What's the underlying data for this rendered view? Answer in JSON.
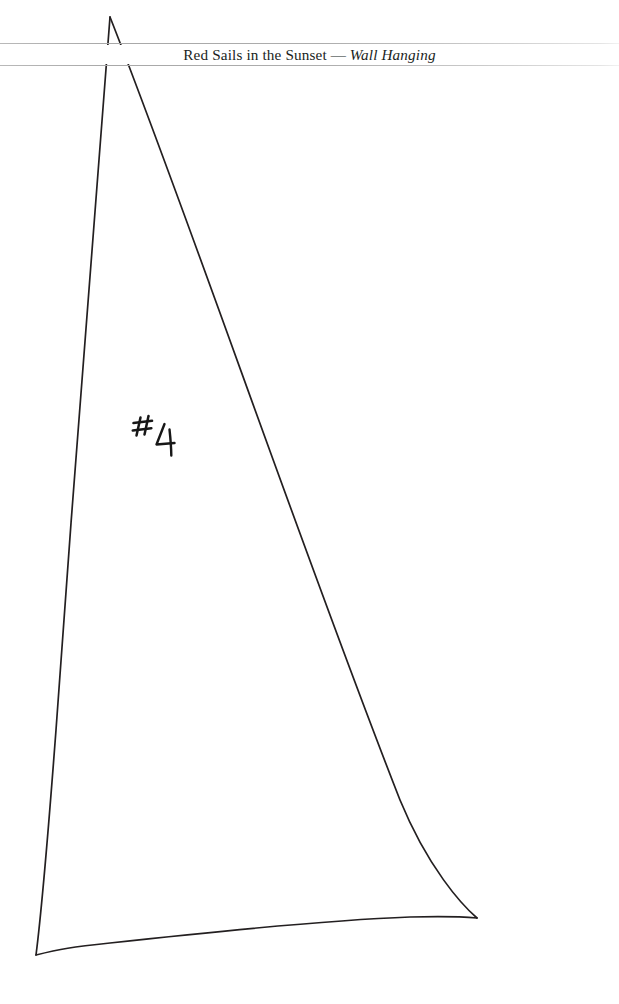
{
  "page": {
    "background_color": "#ffffff",
    "width": 619,
    "height": 1004
  },
  "header": {
    "running_head_plain": "Red Sails in the Sunset",
    "separator": " — ",
    "running_head_italic": "Wall Hanging",
    "full_text": "Red Sails in the Sunset — Wall Hanging",
    "rule_color": "#adadad",
    "text_color": "#201e1d"
  },
  "figure": {
    "name": "sail-pattern-piece",
    "stroke_color": "#231f20",
    "apex": {
      "x": 110,
      "y": 17
    },
    "bottom_left": {
      "x": 36,
      "y": 955
    },
    "bottom_right": {
      "x": 477,
      "y": 918
    }
  },
  "annotation": {
    "piece_number_symbol": "#",
    "piece_number": "4",
    "piece_label": "#4",
    "ink_color": "#171717"
  }
}
